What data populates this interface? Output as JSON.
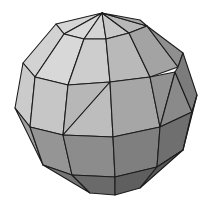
{
  "image": {
    "description": "Low-poly flat-shaded gray sphere",
    "background": "#ffffff",
    "edge_color": "#1c1c1c"
  },
  "faces": [
    {
      "name": "cap-1",
      "points": "102,13 56,24 64,34",
      "fill": "#d6d6d6"
    },
    {
      "name": "cap-2",
      "points": "102,13 64,34 84,39",
      "fill": "#d9d9d9"
    },
    {
      "name": "cap-3",
      "points": "102,13 84,39 106,39",
      "fill": "#d4d4d4"
    },
    {
      "name": "cap-4",
      "points": "102,13 106,39 129,33",
      "fill": "#c8c8c8"
    },
    {
      "name": "cap-5",
      "points": "102,13 129,33 147,26",
      "fill": "#b8b8b8"
    },
    {
      "name": "cap-6",
      "points": "102,13 147,26 140,20",
      "fill": "#a8a8a8"
    },
    {
      "name": "band1-0",
      "points": "56,24 64,34 35,77 23,63",
      "fill": "#d2d2d2"
    },
    {
      "name": "band1-1",
      "points": "64,34 84,39 68,85 35,77",
      "fill": "#d8d8d8"
    },
    {
      "name": "band1-2",
      "points": "84,39 106,39 110,82 68,85",
      "fill": "#cdcdcd"
    },
    {
      "name": "band1-3",
      "points": "106,39 129,33 150,77 110,82",
      "fill": "#b9b9b9"
    },
    {
      "name": "band1-4",
      "points": "129,33 147,26 178,67 150,77",
      "fill": "#a3a3a3"
    },
    {
      "name": "band1-5",
      "points": "147,26 183,53 178,67",
      "fill": "#8f8f8f"
    },
    {
      "name": "band2-0",
      "points": "23,63 35,77 30,127 15,108",
      "fill": "#cbcbcb"
    },
    {
      "name": "band2-1",
      "points": "35,77 68,85 63,135 30,127",
      "fill": "#c6c6c6"
    },
    {
      "name": "band2-2a",
      "points": "68,85 110,82 63,135",
      "fill": "#b7b7b7"
    },
    {
      "name": "band2-2b",
      "points": "110,82 113,137 63,135",
      "fill": "#bdbdbd"
    },
    {
      "name": "band2-3",
      "points": "110,82 150,77 160,127 113,137",
      "fill": "#a6a6a6"
    },
    {
      "name": "band2-4a",
      "points": "150,77 175,72 160,127",
      "fill": "#929292"
    },
    {
      "name": "band2-4b",
      "points": "175,72 192,112 160,127",
      "fill": "#8a8a8a"
    },
    {
      "name": "band2-5",
      "points": "178,67 183,53 197,95 192,112 175,72",
      "fill": "#7c7c7c"
    },
    {
      "name": "band3-0",
      "points": "15,108 30,127 43,165",
      "fill": "#9f9f9f"
    },
    {
      "name": "band3-1",
      "points": "30,127 63,135 72,175 43,165",
      "fill": "#959595"
    },
    {
      "name": "band3-2",
      "points": "63,135 113,137 115,177 72,175",
      "fill": "#8c8c8c"
    },
    {
      "name": "band3-3",
      "points": "113,137 160,127 157,167 115,177",
      "fill": "#7f7f7f"
    },
    {
      "name": "band3-4",
      "points": "160,127 192,112 183,150 157,167",
      "fill": "#6f6f6f"
    },
    {
      "name": "band3-5",
      "points": "192,112 197,95 183,150",
      "fill": "#8e8e8e"
    },
    {
      "name": "base-1",
      "points": "43,165 72,175 90,193",
      "fill": "#747474"
    },
    {
      "name": "base-2",
      "points": "72,175 115,177 115,195 90,193",
      "fill": "#6a6a6a"
    },
    {
      "name": "base-3",
      "points": "115,177 157,167 140,188 115,195",
      "fill": "#5f5f5f"
    },
    {
      "name": "base-4",
      "points": "157,167 183,150 140,188",
      "fill": "#585858"
    }
  ]
}
